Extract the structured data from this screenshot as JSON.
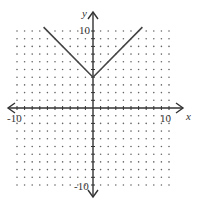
{
  "chart_data": {
    "type": "line",
    "title": "",
    "xlabel": "x",
    "ylabel": "y",
    "xlim": [
      -10,
      10
    ],
    "ylim": [
      -10,
      10
    ],
    "grid": "dots",
    "tick_labels": {
      "x_min": "-10",
      "x_max": "10",
      "y_min": "-10",
      "y_max": "10"
    },
    "series": [
      {
        "name": "y = |x| + 4",
        "x": [
          -6.5,
          0,
          6.5
        ],
        "y": [
          10.5,
          4,
          10.5
        ]
      }
    ],
    "vertex": [
      0,
      4
    ],
    "colors": {
      "curve": "#444444",
      "axes": "#333333",
      "grid_dots": "#666666"
    }
  }
}
